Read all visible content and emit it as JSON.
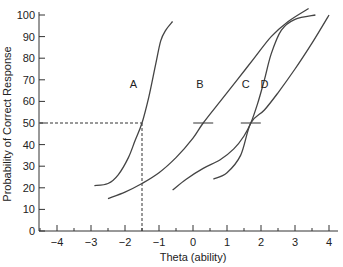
{
  "chart_data": {
    "type": "line",
    "title": "",
    "xlabel": "Theta (ability)",
    "ylabel": "Probability of Correct Response",
    "xlim": [
      -4.5,
      4.2
    ],
    "ylim": [
      0,
      100
    ],
    "x_ticks": [
      -4,
      -3,
      -2,
      -1,
      0,
      1,
      2,
      3,
      4
    ],
    "x_tick_labels": [
      "−4",
      "−3",
      "−2",
      "−1",
      "0",
      "1",
      "2",
      "3",
      "4"
    ],
    "y_ticks": [
      0,
      10,
      20,
      30,
      40,
      50,
      60,
      70,
      80,
      90,
      100
    ],
    "y_tick_labels": [
      "0",
      "10",
      "20",
      "30",
      "40",
      "50",
      "60",
      "70",
      "80",
      "90",
      "100"
    ],
    "grid": false,
    "legend": "none (inline curve labels)",
    "series": [
      {
        "name": "A",
        "x": [
          -2.9,
          -2.5,
          -2.2,
          -1.9,
          -1.7,
          -1.5,
          -1.3,
          -1.1,
          -0.95,
          -0.8,
          -0.6
        ],
        "y": [
          21,
          22,
          26,
          34,
          42,
          50,
          62,
          77,
          88,
          93,
          97
        ],
        "label_pos": [
          -1.75,
          68
        ]
      },
      {
        "name": "B",
        "x": [
          -2.5,
          -2.0,
          -1.5,
          -1.0,
          -0.5,
          0.0,
          0.3,
          0.8,
          1.3,
          1.8,
          2.3,
          2.8,
          3.4
        ],
        "y": [
          15,
          18,
          22,
          27,
          34,
          43,
          50,
          60,
          70,
          80,
          90,
          97,
          103
        ],
        "label_pos": [
          0.2,
          68
        ]
      },
      {
        "name": "C",
        "x": [
          -0.6,
          -0.2,
          0.3,
          0.8,
          1.2,
          1.5,
          1.7,
          1.9,
          2.1,
          2.3,
          2.6,
          3.0,
          3.6
        ],
        "y": [
          19,
          24,
          29,
          33,
          38,
          44,
          50,
          59,
          70,
          82,
          93,
          98,
          100
        ],
        "label_pos": [
          1.55,
          68
        ]
      },
      {
        "name": "D",
        "x": [
          0.6,
          1.0,
          1.4,
          1.7,
          2.1,
          2.5,
          3.0,
          3.5,
          4.0
        ],
        "y": [
          24,
          27,
          35,
          50,
          56,
          64,
          75,
          87,
          100
        ],
        "label_pos": [
          2.1,
          68
        ]
      }
    ],
    "annotations": [
      {
        "type": "dashed-line",
        "from": [
          -4.5,
          50
        ],
        "to": [
          -1.5,
          50
        ],
        "desc": "horizontal dashed line at 50%"
      },
      {
        "type": "dashed-line",
        "from": [
          -1.5,
          0
        ],
        "to": [
          -1.5,
          50
        ],
        "desc": "vertical dashed line at theta = -1.5"
      },
      {
        "type": "tick-mark",
        "at": [
          0.3,
          50
        ],
        "desc": "difficulty marker on curve B"
      },
      {
        "type": "tick-mark",
        "at": [
          1.7,
          50
        ],
        "desc": "difficulty marker for curves C and D"
      }
    ]
  },
  "axes": {
    "x_title": "Theta (ability)",
    "y_title": "Probability of Correct Response"
  },
  "colors": {
    "curve": "#444444",
    "axis": "#333333",
    "dashed": "#333333",
    "background": "#ffffff"
  }
}
